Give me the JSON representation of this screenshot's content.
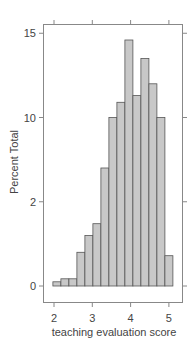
{
  "chart_data": {
    "type": "bar",
    "subtype": "histogram",
    "title": "",
    "xlabel": "teaching evaluation score",
    "ylabel": "Percent Total",
    "xlim": [
      1.9,
      5.3
    ],
    "ylim": [
      -0.8,
      15.5
    ],
    "x_ticks": [
      2,
      3,
      4,
      5
    ],
    "x_tick_labels": [
      "2",
      "3",
      "4",
      "5"
    ],
    "y_ticks": [
      0,
      5,
      10,
      15
    ],
    "y_tick_labels": [
      "0",
      "2",
      "10",
      "15"
    ],
    "bin_width": 0.209,
    "bin_start": 1.97,
    "categories": [
      "2.07",
      "2.28",
      "2.49",
      "2.70",
      "2.91",
      "3.12",
      "3.32",
      "3.53",
      "3.74",
      "3.95",
      "4.16",
      "4.37",
      "4.58",
      "4.79",
      "5.00"
    ],
    "values": [
      0.25,
      0.43,
      0.43,
      2.0,
      3.0,
      3.7,
      7.0,
      10.0,
      10.9,
      14.6,
      11.3,
      13.5,
      12.0,
      10.0,
      1.8
    ],
    "grid": false,
    "legend": null,
    "colors": {
      "bar_fill": "#c8c8c8",
      "bar_stroke": "#555555",
      "frame": "#888888"
    }
  }
}
